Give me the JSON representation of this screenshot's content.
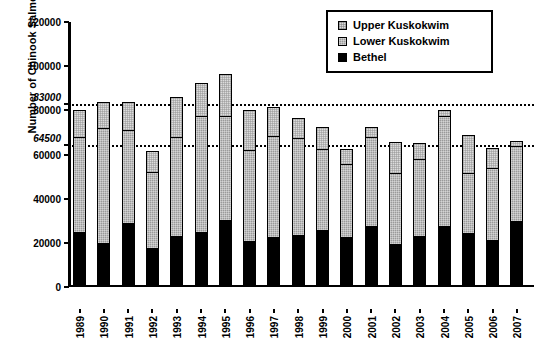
{
  "chart_data": {
    "type": "bar",
    "stacked": true,
    "title": "",
    "xlabel": "",
    "ylabel": "Number of Chinook Salmon",
    "ylim": [
      0,
      120000
    ],
    "ytick_values": [
      0,
      20000,
      40000,
      60000,
      80000,
      100000,
      120000
    ],
    "ytick_labels": [
      "0",
      "20000",
      "40000",
      "60000",
      "80000",
      "100000",
      "120000"
    ],
    "grid": false,
    "legend_position": "top-right",
    "categories": [
      "1989",
      "1990",
      "1991",
      "1992",
      "1993",
      "1994",
      "1995",
      "1996",
      "1997",
      "1998",
      "1999",
      "2000",
      "2001",
      "2002",
      "2003",
      "2004",
      "2005",
      "2006",
      "2007"
    ],
    "series": [
      {
        "name": "Bethel",
        "color": "#000000",
        "values": [
          25000,
          20000,
          29000,
          17500,
          23000,
          25000,
          30500,
          21000,
          22500,
          23500,
          26000,
          22500,
          27500,
          19500,
          23000,
          27500,
          24500,
          21500,
          30000
        ]
      },
      {
        "name": "Lower Kuskokwim",
        "color": "#9a9a9a",
        "values": [
          43000,
          52000,
          42000,
          34500,
          45000,
          52500,
          47000,
          41000,
          46000,
          44000,
          36500,
          33000,
          40500,
          32000,
          35000,
          50000,
          27000,
          32500,
          34000
        ]
      },
      {
        "name": "Upper Kuskokwim",
        "color": "#dcdcdc",
        "values": [
          12000,
          12000,
          13000,
          9500,
          18000,
          15000,
          19000,
          18000,
          13000,
          9000,
          10000,
          7000,
          4500,
          14000,
          7000,
          2500,
          17500,
          9000,
          2000
        ]
      }
    ],
    "totals": [
      80000,
      84000,
      84000,
      61500,
      86000,
      92500,
      96500,
      80000,
      81500,
      76500,
      72500,
      62500,
      72500,
      65500,
      65000,
      80000,
      69000,
      63000,
      66000
    ],
    "reference_lines": [
      {
        "value": 83000,
        "label": "83000",
        "style": "dotted",
        "label_style": "italic"
      },
      {
        "value": 64500,
        "label": "64500",
        "style": "dotted",
        "label_style": "italic"
      }
    ]
  },
  "legend": {
    "items": [
      {
        "label": "Upper Kuskokwim",
        "swatch": "upper"
      },
      {
        "label": "Lower Kuskokwim",
        "swatch": "lower"
      },
      {
        "label": "Bethel",
        "swatch": "bethel"
      }
    ]
  }
}
